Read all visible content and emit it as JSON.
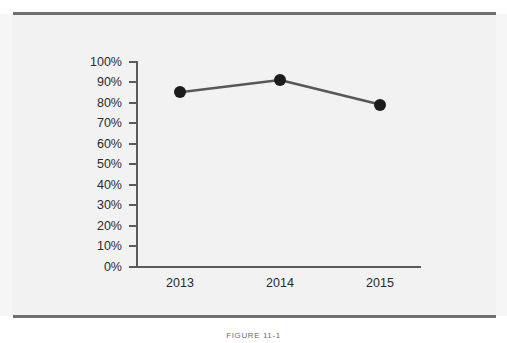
{
  "figure": {
    "caption": "FIGURE 11-1",
    "background_color": "#f2f2f2",
    "rule_color": "#6f6f72"
  },
  "chart_data": {
    "type": "line",
    "title": "",
    "xlabel": "",
    "ylabel": "",
    "categories": [
      "2013",
      "2014",
      "2015"
    ],
    "values": [
      85,
      91,
      79
    ],
    "value_labels": [
      "85%",
      "91%",
      "79%"
    ],
    "ylim": [
      0,
      100
    ],
    "ytick_values": [
      0,
      10,
      20,
      30,
      40,
      50,
      60,
      70,
      80,
      90,
      100
    ],
    "ytick_labels": [
      "0%",
      "10%",
      "20%",
      "30%",
      "40%",
      "50%",
      "60%",
      "70%",
      "80%",
      "90%",
      "100%"
    ],
    "grid": false,
    "legend": false,
    "legend_position": "none",
    "line_color": "#58585b",
    "marker_color": "#1c1c1c",
    "marker_shape": "circle",
    "axis_color": "#5a5a5d"
  }
}
